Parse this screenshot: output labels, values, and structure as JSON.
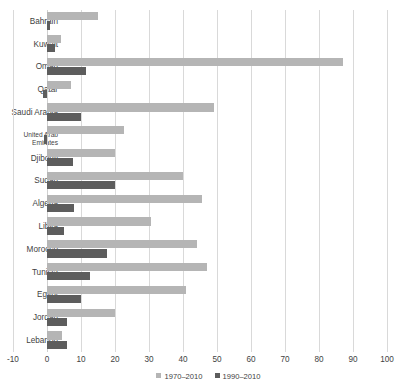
{
  "chart_data": {
    "type": "bar",
    "orientation": "horizontal",
    "title": "",
    "xlabel": "",
    "ylabel": "",
    "xlim": [
      -10,
      100
    ],
    "xticks": [
      -10,
      0,
      10,
      20,
      30,
      40,
      50,
      60,
      70,
      80,
      90,
      100
    ],
    "grid": true,
    "legend_position": "bottom",
    "categories": [
      "Bahrain",
      "Kuwait",
      "Oman",
      "Qatar",
      "Saudi Arabia",
      "United Arab\nEmirates",
      "Djibouti",
      "Sudan",
      "Algeria",
      "Libya",
      "Morocco",
      "Tunisia",
      "Egypt",
      "Jordan",
      "Lebanon"
    ],
    "series": [
      {
        "name": "1970–2010",
        "color": "#b5b5b5",
        "values": [
          15,
          4,
          87,
          7,
          49,
          22.6,
          20,
          40,
          45.6,
          30.6,
          44,
          47,
          41,
          20,
          4.4
        ]
      },
      {
        "name": "1990–2010",
        "color": "#5d5d5d",
        "values": [
          1,
          2.4,
          11.5,
          -1.2,
          10,
          -1,
          7.6,
          20,
          8,
          5,
          17.6,
          12.6,
          10,
          5.8,
          5.8
        ]
      }
    ]
  },
  "legend": {
    "items": [
      {
        "label": "1970–2010",
        "color": "#b5b5b5"
      },
      {
        "label": "1990–2010",
        "color": "#5d5d5d"
      }
    ]
  },
  "axis": {
    "tick_labels": [
      "-10",
      "0",
      "10",
      "20",
      "30",
      "40",
      "50",
      "60",
      "70",
      "80",
      "90",
      "100"
    ]
  }
}
